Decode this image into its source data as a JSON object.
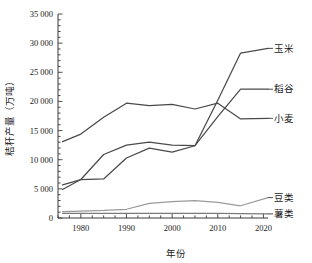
{
  "chart_data": {
    "type": "line",
    "title": "",
    "xlabel": "年份",
    "ylabel": "秸秆产量（万吨）",
    "xlim": [
      1975,
      2021
    ],
    "ylim": [
      0,
      35000
    ],
    "xticks": [
      "1980",
      "1990",
      "2000",
      "2010",
      "2020"
    ],
    "xtick_values": [
      1980,
      1990,
      2000,
      2010,
      2020
    ],
    "yticks": [
      "0",
      "5 000",
      "10 000",
      "15 000",
      "20 000",
      "25 000",
      "30 000",
      "35 000"
    ],
    "ytick_values": [
      0,
      5000,
      10000,
      15000,
      20000,
      25000,
      30000,
      35000
    ],
    "minor_tick_step": 1000,
    "grid": false,
    "legend_position": "right-inline",
    "x": [
      1976,
      1980,
      1985,
      1990,
      1995,
      2000,
      2005,
      2010,
      2015,
      2021
    ],
    "series": [
      {
        "name": "玉米",
        "label": "玉米",
        "color": "#4a4a4a",
        "values": [
          4900,
          6600,
          6700,
          10300,
          12000,
          11300,
          12400,
          20200,
          28300,
          29100
        ]
      },
      {
        "name": "稻谷",
        "label": "稻谷",
        "color": "#4a4a4a",
        "values": [
          5700,
          6600,
          10900,
          12500,
          13000,
          12500,
          12400,
          17400,
          22100,
          22100
        ]
      },
      {
        "name": "小麦",
        "label": "小麦",
        "color": "#4a4a4a",
        "values": [
          13100,
          14400,
          17300,
          19700,
          19300,
          19500,
          18700,
          19700,
          17000,
          17100
        ]
      },
      {
        "name": "豆类",
        "label": "豆类",
        "color": "#9a9a9a",
        "values": [
          1100,
          1200,
          1300,
          1500,
          2500,
          2800,
          3000,
          2700,
          2100,
          3500
        ]
      },
      {
        "name": "薯类",
        "label": "薯类",
        "color": "#7a7a7a",
        "values": [
          800,
          800,
          800,
          800,
          800,
          800,
          800,
          800,
          750,
          700
        ]
      }
    ]
  }
}
